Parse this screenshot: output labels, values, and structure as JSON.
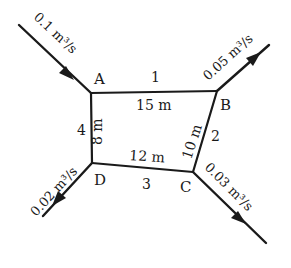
{
  "diagram": {
    "type": "pipe-network",
    "colors": {
      "line": "#1a1a1a",
      "background": "#ffffff"
    },
    "nodes": [
      {
        "id": "A",
        "label": "A",
        "x": 91,
        "y": 93
      },
      {
        "id": "B",
        "label": "B",
        "x": 217,
        "y": 91
      },
      {
        "id": "C",
        "label": "C",
        "x": 193,
        "y": 172
      },
      {
        "id": "D",
        "label": "D",
        "x": 92,
        "y": 163
      }
    ],
    "pipes": [
      {
        "id": "1",
        "label": "1",
        "from": "A",
        "to": "B",
        "length": "15 m"
      },
      {
        "id": "2",
        "label": "2",
        "from": "B",
        "to": "C",
        "length": "10 m"
      },
      {
        "id": "3",
        "label": "3",
        "from": "C",
        "to": "D",
        "length": "12 m"
      },
      {
        "id": "4",
        "label": "4",
        "from": "D",
        "to": "A",
        "length": "8 m"
      }
    ],
    "flows": [
      {
        "node": "A",
        "direction": "inflow",
        "value": "0.1 m³/s"
      },
      {
        "node": "B",
        "direction": "outflow",
        "value": "0.05 m³/s"
      },
      {
        "node": "C",
        "direction": "outflow",
        "value": "0.03 m³/s"
      },
      {
        "node": "D",
        "direction": "outflow",
        "value": "0.02 m³/s"
      }
    ]
  }
}
